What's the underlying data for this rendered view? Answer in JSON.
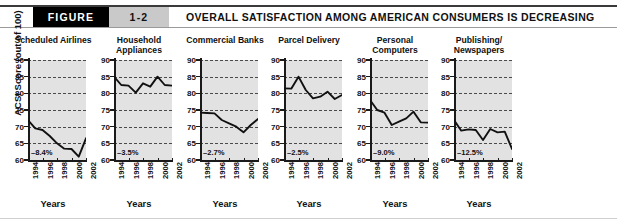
{
  "header": {
    "figure_label": "FIGURE",
    "figure_number": "1-2",
    "title": "OVERALL SATISFACTION AMONG AMERICAN CONSUMERS IS DECREASING"
  },
  "axes": {
    "y_label": "ACSI Score (out of 100)",
    "x_label": "Years",
    "y_ticks": [
      "90",
      "85",
      "80",
      "75",
      "70",
      "65",
      "60"
    ],
    "x_ticks": [
      "1994",
      "1996",
      "1998",
      "2000",
      "2002"
    ]
  },
  "colors": {
    "plot_background": "#e2e2e2",
    "series_line": "#111111",
    "gridline": "#4a4a4a",
    "badge_figure_bg": "#000000",
    "badge_number_bg": "#c9c9c9",
    "rule": "#3a3a3a"
  },
  "chart_data": {
    "type": "line",
    "title": "OVERALL SATISFACTION AMONG AMERICAN CONSUMERS IS DECREASING",
    "xlabel": "Years",
    "ylabel": "ACSI Score (out of 100)",
    "ylim": [
      60,
      90
    ],
    "xlim": [
      1994,
      2002
    ],
    "grid": true,
    "legend": "none",
    "panels": [
      {
        "title": "Scheduled Airlines",
        "delta": "–8.4%",
        "x": [
          1994,
          1995,
          1996,
          1997,
          1998,
          1999,
          2000,
          2001,
          2002
        ],
        "values": [
          72.0,
          69.5,
          69.0,
          67.2,
          65.0,
          63.4,
          63.3,
          61.0,
          66.5
        ]
      },
      {
        "title": "Household Appliances",
        "delta": "–3.5%",
        "x": [
          1994,
          1995,
          1996,
          1997,
          1998,
          1999,
          2000,
          2001,
          2002
        ],
        "values": [
          85.0,
          82.5,
          82.3,
          80.2,
          83.0,
          82.0,
          85.0,
          82.5,
          82.3
        ]
      },
      {
        "title": "Commercial Banks",
        "delta": "–2.7%",
        "x": [
          1994,
          1995,
          1996,
          1997,
          1998,
          1999,
          2000,
          2001,
          2002
        ],
        "values": [
          74.2,
          74.1,
          74.0,
          72.0,
          71.0,
          70.0,
          68.3,
          70.5,
          72.3
        ]
      },
      {
        "title": "Parcel Delivery",
        "delta": "–2.5%",
        "x": [
          1994,
          1995,
          1996,
          1997,
          1998,
          1999,
          2000,
          2001,
          2002
        ],
        "values": [
          81.5,
          81.4,
          85.0,
          81.0,
          78.5,
          79.0,
          80.5,
          78.3,
          79.5
        ]
      },
      {
        "title": "Personal Computers",
        "delta": "–9.0%",
        "x": [
          1994,
          1995,
          1996,
          1997,
          1998,
          1999,
          2000,
          2001,
          2002
        ],
        "values": [
          78.0,
          75.0,
          74.2,
          70.5,
          71.5,
          72.5,
          74.5,
          71.3,
          71.2
        ]
      },
      {
        "title": "Publishing/ Newspapers",
        "delta": "–12.5%",
        "x": [
          1994,
          1995,
          1996,
          1997,
          1998,
          1999,
          2000,
          2001,
          2002
        ],
        "values": [
          72.0,
          68.8,
          69.2,
          69.0,
          66.0,
          69.3,
          68.3,
          68.5,
          63.3
        ]
      }
    ]
  }
}
